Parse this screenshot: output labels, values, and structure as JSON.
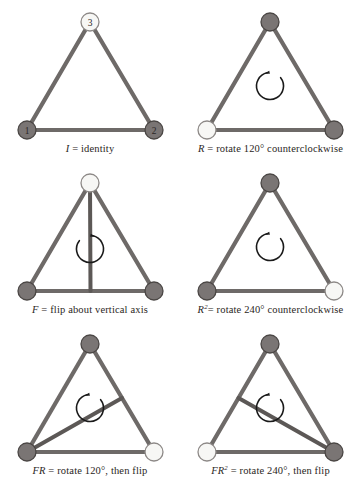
{
  "figure": {
    "background_color": "#ffffff",
    "edge_color": "#6e6a68",
    "edge_dark_color": "#5c5856",
    "vertex_dark_fill": "#7a7574",
    "vertex_light_fill": "#f7f7f5",
    "vertex_stroke": "#4a4644",
    "arrow_color": "#1a1a1a",
    "label_color": "#2a2623"
  },
  "panels": [
    {
      "id": "identity",
      "caption_symbol": "I",
      "caption_sup": "",
      "caption_rest": " = identity",
      "vertices": [
        {
          "name": "vertex-top",
          "fill": "light",
          "label": "3"
        },
        {
          "name": "vertex-bottom-left",
          "fill": "dark",
          "label": "1"
        },
        {
          "name": "vertex-bottom-right",
          "fill": "dark",
          "label": "2"
        }
      ],
      "axis": "none",
      "arrow": "none"
    },
    {
      "id": "rotate-120",
      "caption_symbol": "R",
      "caption_sup": "",
      "caption_rest": " = rotate 120° counterclockwise",
      "vertices": [
        {
          "name": "vertex-top",
          "fill": "dark",
          "label": ""
        },
        {
          "name": "vertex-bottom-left",
          "fill": "light",
          "label": ""
        },
        {
          "name": "vertex-bottom-right",
          "fill": "dark",
          "label": ""
        }
      ],
      "axis": "none",
      "arrow": "counterclockwise"
    },
    {
      "id": "flip-vertical",
      "caption_symbol": "F",
      "caption_sup": "",
      "caption_rest": " = flip about vertical axis",
      "vertices": [
        {
          "name": "vertex-top",
          "fill": "light",
          "label": ""
        },
        {
          "name": "vertex-bottom-left",
          "fill": "dark",
          "label": ""
        },
        {
          "name": "vertex-bottom-right",
          "fill": "dark",
          "label": ""
        }
      ],
      "axis": "vertical",
      "arrow": "clockwise"
    },
    {
      "id": "rotate-240",
      "caption_symbol": "R",
      "caption_sup": "2",
      "caption_rest": "= rotate 240° counterclockwise",
      "vertices": [
        {
          "name": "vertex-top",
          "fill": "dark",
          "label": ""
        },
        {
          "name": "vertex-bottom-left",
          "fill": "dark",
          "label": ""
        },
        {
          "name": "vertex-bottom-right",
          "fill": "light",
          "label": ""
        }
      ],
      "axis": "none",
      "arrow": "counterclockwise"
    },
    {
      "id": "flip-rotate-120",
      "caption_symbol": "FR",
      "caption_sup": "",
      "caption_rest": " = rotate 120°, then flip",
      "vertices": [
        {
          "name": "vertex-top",
          "fill": "dark",
          "label": ""
        },
        {
          "name": "vertex-bottom-left",
          "fill": "dark",
          "label": ""
        },
        {
          "name": "vertex-bottom-right",
          "fill": "light",
          "label": ""
        }
      ],
      "axis": "left-vertex-to-right-edge",
      "arrow": "counterclockwise"
    },
    {
      "id": "flip-rotate-240",
      "caption_symbol": "FR",
      "caption_sup": "2",
      "caption_rest": " = rotate 240°, then flip",
      "vertices": [
        {
          "name": "vertex-top",
          "fill": "dark",
          "label": ""
        },
        {
          "name": "vertex-bottom-left",
          "fill": "light",
          "label": ""
        },
        {
          "name": "vertex-bottom-right",
          "fill": "dark",
          "label": ""
        }
      ],
      "axis": "right-vertex-to-left-edge",
      "arrow": "counterclockwise"
    }
  ]
}
